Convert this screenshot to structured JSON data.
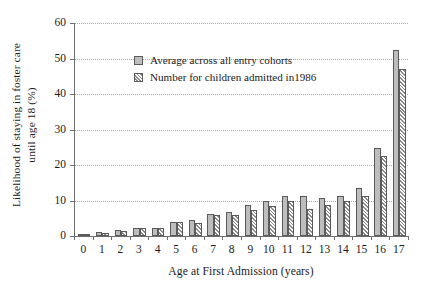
{
  "chart_data": {
    "type": "bar",
    "title": "",
    "xlabel": "Age at First Admission (years)",
    "ylabel": "Likelihood of staying in foster care until age 18 (%)",
    "ylabel_line1": "Likelihood of staying in foster care",
    "ylabel_line2": "until age 18 (%)",
    "categories": [
      "0",
      "1",
      "2",
      "3",
      "4",
      "5",
      "6",
      "7",
      "8",
      "9",
      "10",
      "11",
      "12",
      "13",
      "14",
      "15",
      "16",
      "17"
    ],
    "ylim": [
      0,
      60
    ],
    "yticks": [
      0,
      10,
      20,
      30,
      40,
      50,
      60
    ],
    "grid": true,
    "legend_position": "upper-left-inside",
    "series": [
      {
        "name": "Average across all entry cohorts",
        "style": "solid-gray",
        "color": "#bdbdbd",
        "values": [
          0.3,
          1.0,
          1.8,
          2.2,
          2.3,
          3.9,
          4.4,
          6.1,
          6.9,
          8.8,
          10.0,
          11.3,
          11.4,
          10.8,
          11.4,
          13.5,
          24.9,
          52.5
        ]
      },
      {
        "name": "Number for children admitted in1986",
        "style": "hatched",
        "color": "#8a8a8a",
        "values": [
          0.3,
          0.9,
          1.5,
          2.2,
          2.3,
          3.9,
          3.6,
          5.8,
          6.0,
          7.3,
          8.4,
          9.9,
          7.7,
          8.8,
          9.8,
          11.4,
          22.5,
          47.0
        ]
      }
    ]
  },
  "legend": {
    "items": [
      {
        "label": "Average across all entry cohorts",
        "swatch": "solid-gray-swatch"
      },
      {
        "label": "Number for children admitted in1986",
        "swatch": "hatched-swatch"
      }
    ]
  },
  "axes": {
    "y_tick_labels": [
      "0",
      "10",
      "20",
      "30",
      "40",
      "50",
      "60"
    ],
    "x_tick_labels": [
      "0",
      "1",
      "2",
      "3",
      "4",
      "5",
      "6",
      "7",
      "8",
      "9",
      "10",
      "11",
      "12",
      "13",
      "14",
      "15",
      "16",
      "17"
    ],
    "x_title": "Age at First Admission (years)",
    "y_title_line1": "Likelihood of staying in foster care",
    "y_title_line2": "until age 18 (%)"
  },
  "colors": {
    "series_a": "#bdbdbd",
    "series_b": "#8a8a8a",
    "axis": "#6e6e6e",
    "grid": "#a8a8a8",
    "background": "#ffffff"
  }
}
